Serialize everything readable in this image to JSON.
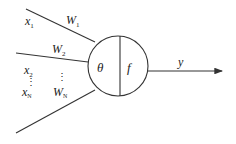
{
  "diagram": {
    "type": "neuron-model",
    "inputs": [
      {
        "name": "x",
        "sub": "1"
      },
      {
        "name": "x",
        "sub": "2"
      },
      {
        "name": "x",
        "sub": "N"
      }
    ],
    "weights": [
      {
        "name": "W",
        "sub": "1"
      },
      {
        "name": "W",
        "sub": "2"
      },
      {
        "name": "W",
        "sub": "N"
      }
    ],
    "ellipsis": "⋮",
    "node": {
      "threshold_label": "θ",
      "function_label": "f"
    },
    "output": {
      "label": "y"
    }
  }
}
